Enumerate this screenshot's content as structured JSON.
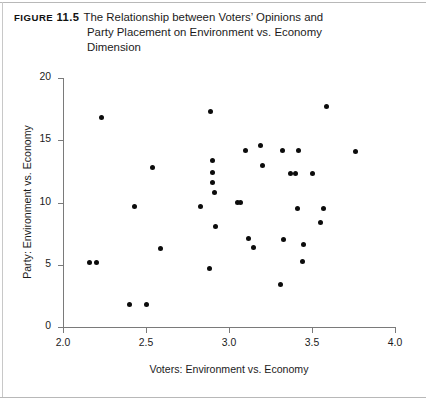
{
  "figure": {
    "tag_prefix": "Figure",
    "tag_number": "11.5",
    "caption_line_1": "The Relationship between Voters’ Opinions and",
    "caption_line_2": "Party Placement on Environment vs. Economy",
    "caption_line_3": "Dimension"
  },
  "chart_data": {
    "type": "scatter",
    "title": "The Relationship between Voters’ Opinions and Party Placement on Environment vs. Economy Dimension",
    "xlabel": "Voters: Environment vs. Economy",
    "ylabel": "Party: Environment vs. Economy",
    "xlim": [
      2.0,
      4.0
    ],
    "ylim": [
      0,
      20
    ],
    "xticks": [
      2.0,
      2.5,
      3.0,
      3.5,
      4.0
    ],
    "xticklabels": [
      "2.0",
      "2.5",
      "3.0",
      "3.5",
      "4.0"
    ],
    "yticks": [
      0,
      5,
      10,
      15,
      20
    ],
    "yticklabels": [
      "0",
      "5",
      "10",
      "15",
      "20"
    ],
    "grid": false,
    "legend": null,
    "marker": "circle",
    "marker_color": "#0c0c0c",
    "marker_size": 5,
    "points": [
      [
        2.16,
        5.2
      ],
      [
        2.2,
        5.2
      ],
      [
        2.23,
        16.8
      ],
      [
        2.4,
        1.8
      ],
      [
        2.43,
        9.7
      ],
      [
        2.5,
        1.8
      ],
      [
        2.54,
        12.8
      ],
      [
        2.59,
        6.3
      ],
      [
        2.83,
        9.7
      ],
      [
        2.88,
        4.7
      ],
      [
        2.89,
        17.3
      ],
      [
        2.9,
        13.4
      ],
      [
        2.9,
        12.4
      ],
      [
        2.9,
        11.6
      ],
      [
        2.91,
        10.8
      ],
      [
        2.92,
        8.1
      ],
      [
        3.05,
        10.0
      ],
      [
        3.07,
        10.0
      ],
      [
        3.1,
        14.2
      ],
      [
        3.12,
        7.1
      ],
      [
        3.15,
        6.4
      ],
      [
        3.19,
        14.6
      ],
      [
        3.2,
        13.0
      ],
      [
        3.31,
        3.4
      ],
      [
        3.32,
        14.2
      ],
      [
        3.33,
        7.0
      ],
      [
        3.37,
        12.3
      ],
      [
        3.4,
        12.3
      ],
      [
        3.41,
        9.5
      ],
      [
        3.42,
        14.2
      ],
      [
        3.44,
        5.3
      ],
      [
        3.45,
        6.6
      ],
      [
        3.5,
        12.3
      ],
      [
        3.55,
        8.4
      ],
      [
        3.57,
        9.5
      ],
      [
        3.59,
        17.7
      ],
      [
        3.76,
        14.1
      ]
    ]
  }
}
